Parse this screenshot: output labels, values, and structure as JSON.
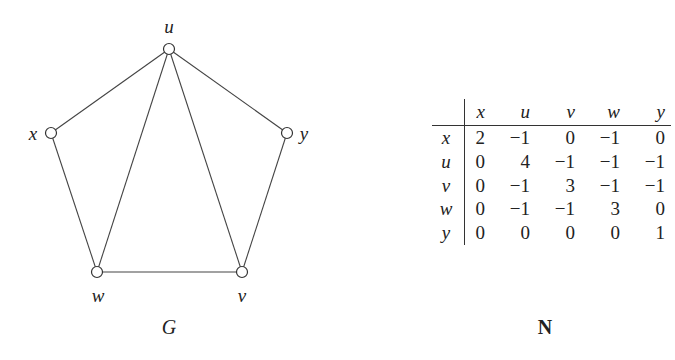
{
  "graph": {
    "name": "G",
    "nodes": [
      {
        "id": "u",
        "x": 169,
        "y": 49,
        "label_x": 169,
        "label_y": 27
      },
      {
        "id": "x",
        "x": 51,
        "y": 133,
        "label_x": 33,
        "label_y": 134
      },
      {
        "id": "y",
        "x": 287,
        "y": 133,
        "label_x": 304,
        "label_y": 134
      },
      {
        "id": "w",
        "x": 97,
        "y": 272,
        "label_x": 98,
        "label_y": 296
      },
      {
        "id": "v",
        "x": 242,
        "y": 272,
        "label_x": 242,
        "label_y": 296
      }
    ],
    "edges": [
      [
        "u",
        "x"
      ],
      [
        "u",
        "w"
      ],
      [
        "u",
        "v"
      ],
      [
        "u",
        "y"
      ],
      [
        "x",
        "w"
      ],
      [
        "w",
        "v"
      ],
      [
        "v",
        "y"
      ]
    ],
    "caption": "G"
  },
  "matrix": {
    "name": "N",
    "col_headers": [
      "x",
      "u",
      "v",
      "w",
      "y"
    ],
    "rows": [
      {
        "header": "x",
        "values": [
          "2",
          "−1",
          "0",
          "−1",
          "0"
        ]
      },
      {
        "header": "u",
        "values": [
          "0",
          "4",
          "−1",
          "−1",
          "−1"
        ]
      },
      {
        "header": "v",
        "values": [
          "0",
          "−1",
          "3",
          "−1",
          "−1"
        ]
      },
      {
        "header": "w",
        "values": [
          "0",
          "−1",
          "−1",
          "3",
          "0"
        ]
      },
      {
        "header": "y",
        "values": [
          "0",
          "0",
          "0",
          "0",
          "1"
        ]
      }
    ],
    "caption": "N"
  }
}
